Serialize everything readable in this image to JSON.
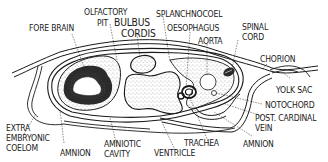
{
  "figure": {
    "type": "labeled anatomical diagram",
    "colors": {
      "ink": "#1a1a1a",
      "stipple": "#9a9a9a",
      "background": "#ffffff"
    },
    "labels": {
      "fore_brain": "FORE BRAIN",
      "olfactory": "OLFACTORY",
      "pit": "PIT",
      "bulbus": "BULBUS",
      "cordis": "CORDIS",
      "splanchnocoel": "SPLANCHNOCOEL",
      "oesophagus": "OESOPHAGUS",
      "aorta": "AORTA",
      "spinal": "SPINAL",
      "cord": "CORD",
      "chorion": "CHORION",
      "yolk_sac": "YOLK SAC",
      "notochord": "NOTOCHORD",
      "post_cardinal": "POST. CARDINAL",
      "vein": "VEIN",
      "amnion_right": "AMNION",
      "trachea": "TRACHEA",
      "ventricle": "VENTRICLE",
      "amniotic": "AMNIOTIC",
      "cavity": "CAVITY",
      "amnion_left": "AMNION",
      "extra": "EXTRA",
      "embryonic": "EMBRYONIC",
      "coelom": "COELOM"
    }
  }
}
